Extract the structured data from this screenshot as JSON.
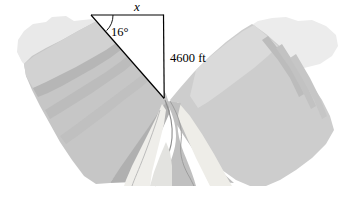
{
  "figure": {
    "caption": "",
    "background_color": "#ffffff"
  },
  "labels": {
    "unknown_side": "x",
    "angle": "16°",
    "depth": "4600 ft"
  },
  "geometry": {
    "apex_top_left": [
      91,
      15
    ],
    "corner_top_right": [
      163,
      15
    ],
    "vertex_bottom": [
      164,
      98
    ],
    "angle_value_degrees": 16,
    "depth_value": 4600,
    "depth_units": "ft",
    "hypotenuse_label": "x",
    "line_color": "#000000",
    "line_width": 1.1
  },
  "palette": {
    "plateau_light": "#e8e8e8",
    "plateau_lighter": "#efefef",
    "slope_mid": "#c9c9c9",
    "slope_dark": "#b3b3b3",
    "slope_darker": "#a6a6a6",
    "slope_light": "#d6d6d6",
    "river_band": "#f0f0ee",
    "river_water": "#bdbdbd",
    "river_outline": "#8a8a8a",
    "sandbar": "#efeee9",
    "background": "#ffffff"
  },
  "terrain": {
    "description": "V-shaped canyon, light gray plateaus at left and right edges, medium gray sloping walls with ridge striations, winding river at the bottom center",
    "left_plateau_extent_x": [
      18,
      120
    ],
    "right_plateau_extent_x": [
      236,
      338
    ],
    "canyon_bottom_y": 186
  }
}
